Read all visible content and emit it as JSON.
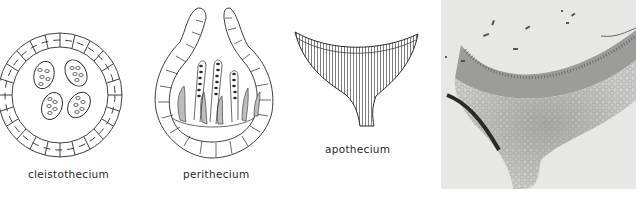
{
  "figure": {
    "panels": [
      {
        "id": "cleistothecium",
        "label": "cleistothecium",
        "type": "line-drawing"
      },
      {
        "id": "perithecium",
        "label": "perithecium",
        "type": "line-drawing"
      },
      {
        "id": "apothecium",
        "label": "apothecium",
        "type": "line-drawing"
      },
      {
        "id": "apothecium-photo",
        "label": "",
        "type": "micrograph"
      }
    ]
  },
  "colors": {
    "ink": "#2a2a2a",
    "paraphyses_fill": "#bdbdbd",
    "photo_background": "#e7e7e5",
    "photo_tissue": "#8a8a88"
  }
}
